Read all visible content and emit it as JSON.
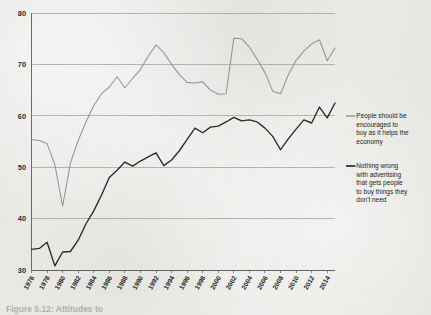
{
  "figure": {
    "background_color": "#ececea",
    "caption_partial": "Figure 5.12: Attitudes to"
  },
  "legend": {
    "position": "right",
    "entries": [
      {
        "id": "encouraged-to-buy",
        "color": "#8c8c8c",
        "label": "People should be encouraged to buy as it helps the economy",
        "lines": [
          "People should be",
          "encouraged to",
          "buy as it helps the",
          "economy"
        ]
      },
      {
        "id": "nothing-wrong-advertising",
        "color": "#1f1f1f",
        "label": "Nothing wrong with advertising that gets people to buy things they don't need",
        "lines": [
          "Nothing wrong",
          "with advertising",
          "that gets people",
          "to buy things they",
          "don't need"
        ]
      }
    ]
  },
  "axes": {
    "y_ticks": [
      "30",
      "40",
      "50",
      "60",
      "70",
      "80"
    ],
    "x_ticks": [
      "1976",
      "1978",
      "1980",
      "1982",
      "1984",
      "1986",
      "1988",
      "1990",
      "1992",
      "1994",
      "1996",
      "1998",
      "2000",
      "2002",
      "2004",
      "2006",
      "2008",
      "2010",
      "2012",
      "2014"
    ]
  },
  "chart_data": {
    "type": "line",
    "title": "",
    "subtitle": "",
    "xlabel": "",
    "ylabel": "",
    "xlim": [
      1976,
      2015
    ],
    "ylim": [
      30,
      80
    ],
    "grid": true,
    "grid_axis": "y",
    "legend_position": "right",
    "x": [
      1976,
      1977,
      1978,
      1979,
      1980,
      1981,
      1982,
      1983,
      1984,
      1985,
      1986,
      1987,
      1988,
      1989,
      1990,
      1991,
      1992,
      1993,
      1994,
      1995,
      1996,
      1997,
      1998,
      1999,
      2000,
      2001,
      2002,
      2003,
      2004,
      2005,
      2006,
      2007,
      2008,
      2009,
      2010,
      2011,
      2012,
      2013,
      2014,
      2015
    ],
    "series": [
      {
        "name": "People should be encouraged to buy as it helps the economy",
        "color": "#8c8c8c",
        "values": [
          55.4,
          55.2,
          54.6,
          50.5,
          42.4,
          50.8,
          55.2,
          58.8,
          62.0,
          64.3,
          65.6,
          67.6,
          65.4,
          67.3,
          69.0,
          71.6,
          73.8,
          72.3,
          70.0,
          68.0,
          66.5,
          66.4,
          66.6,
          65.0,
          64.2,
          64.3,
          75.1,
          75.0,
          73.4,
          71.0,
          68.4,
          64.8,
          64.3,
          68.0,
          70.8,
          72.6,
          74.0,
          74.8,
          70.7,
          73.2
        ]
      },
      {
        "name": "Nothing wrong with advertising that gets people to buy things they don't need",
        "color": "#1f1f1f",
        "values": [
          34.0,
          34.2,
          35.4,
          30.8,
          33.5,
          33.6,
          35.8,
          39.0,
          41.5,
          44.6,
          48.0,
          49.4,
          51.0,
          50.2,
          51.2,
          52.0,
          52.8,
          50.3,
          51.4,
          53.2,
          55.4,
          57.6,
          56.7,
          57.8,
          58.0,
          58.8,
          59.7,
          59.0,
          59.2,
          58.8,
          57.6,
          56.0,
          53.4,
          55.5,
          57.4,
          59.2,
          58.6,
          61.7,
          59.6,
          62.5
        ]
      }
    ]
  }
}
